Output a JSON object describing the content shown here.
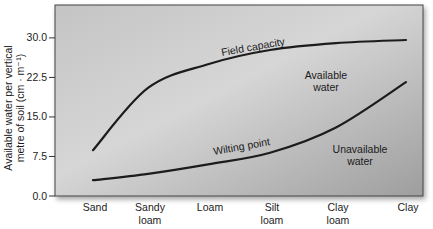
{
  "chart_data": {
    "type": "line",
    "title": "",
    "xlabel": "",
    "ylabel": "Available water per vertical metre of soil (cm · m⁻¹)",
    "ylabel_lines": [
      "Available water per vertical",
      "metre of soil (cm · m⁻¹)"
    ],
    "ylim": [
      0,
      33
    ],
    "yticks": [
      0.0,
      7.5,
      15.0,
      22.5,
      30.0
    ],
    "ytick_labels": [
      "0.0",
      "7.5",
      "15.0",
      "22.5",
      "30.0"
    ],
    "categories": [
      "Sand",
      "Sandy loam",
      "Loam",
      "Silt loam",
      "Clay loam",
      "Clay"
    ],
    "category_lines": [
      [
        "Sand"
      ],
      [
        "Sandy",
        "loam"
      ],
      [
        "Loam"
      ],
      [
        "Silt",
        "loam"
      ],
      [
        "Clay",
        "loam"
      ],
      [
        "Clay"
      ]
    ],
    "grid": false,
    "legend": "none (inline curve labels)",
    "series": [
      {
        "name": "Field capacity",
        "values": [
          8.7,
          20.5,
          25.0,
          27.7,
          29.0,
          29.6
        ]
      },
      {
        "name": "Wilting point",
        "values": [
          3.0,
          4.2,
          6.0,
          8.2,
          13.0,
          21.6
        ]
      }
    ],
    "annotations": [
      {
        "text": "Field capacity",
        "position": "along upper curve"
      },
      {
        "text": "Wilting point",
        "position": "along lower curve"
      },
      {
        "text": "Available water",
        "lines": [
          "Available",
          "water"
        ],
        "position": "between curves, right"
      },
      {
        "text": "Unavailable water",
        "lines": [
          "Unavailable",
          "water"
        ],
        "position": "below lower curve, right"
      }
    ]
  },
  "colors": {
    "plot_bg_light": "#cfcfcf",
    "plot_bg_dark": "#a8a8a8",
    "line": "#1c1c1c",
    "text": "#1a1a1a"
  }
}
